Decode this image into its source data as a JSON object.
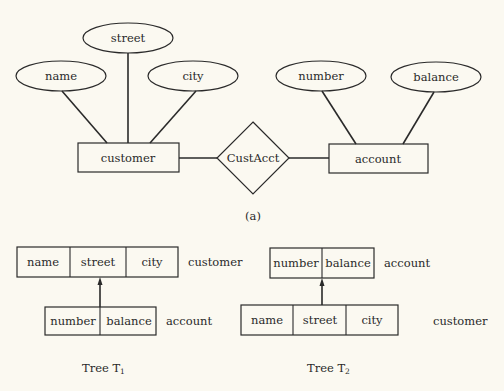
{
  "figure": {
    "part_a": {
      "caption": "(a)",
      "entities": [
        {
          "id": "customer",
          "label": "customer"
        },
        {
          "id": "account",
          "label": "account"
        }
      ],
      "relationship": {
        "id": "custacct",
        "label": "CustAcct"
      },
      "attributes": {
        "customer": [
          {
            "id": "name",
            "label": "name"
          },
          {
            "id": "street",
            "label": "street"
          },
          {
            "id": "city",
            "label": "city"
          }
        ],
        "account": [
          {
            "id": "number",
            "label": "number"
          },
          {
            "id": "balance",
            "label": "balance"
          }
        ]
      }
    },
    "tree1": {
      "caption": "Tree T",
      "subscript": "1",
      "root": {
        "record": "customer",
        "fields": [
          "name",
          "street",
          "city"
        ]
      },
      "child": {
        "record": "account",
        "fields": [
          "number",
          "balance"
        ]
      }
    },
    "tree2": {
      "caption": "Tree T",
      "subscript": "2",
      "root": {
        "record": "account",
        "fields": [
          "number",
          "balance"
        ]
      },
      "child": {
        "record": "customer",
        "fields": [
          "name",
          "street",
          "city"
        ]
      }
    }
  }
}
